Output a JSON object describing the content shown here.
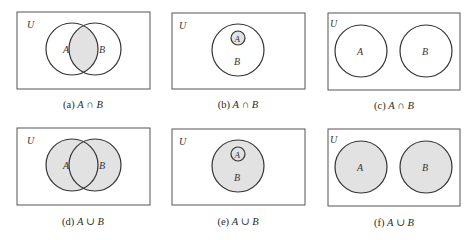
{
  "figure": {
    "colors": {
      "stroke": "#333333",
      "box_stroke": "#555555",
      "shade": "#e2e2e2",
      "background": "#ffffff"
    },
    "universe_label": "U",
    "set_a_label": "A",
    "set_b_label": "B",
    "panels": [
      {
        "id": "a",
        "caption_prefix": "(a)",
        "left": "A",
        "operator": "∩",
        "right": "B",
        "relation": "overlapping",
        "operation": "intersection",
        "shaded_region": "A ∩ B (lens where the circles overlap)"
      },
      {
        "id": "b",
        "caption_prefix": "(b)",
        "left": "A",
        "operator": "∩",
        "right": "B",
        "relation": "A subset of B",
        "operation": "intersection",
        "shaded_region": "A (A ∩ B = A because A ⊂ B)"
      },
      {
        "id": "c",
        "caption_prefix": "(c)",
        "left": "A",
        "operator": "∩",
        "right": "B",
        "relation": "disjoint",
        "operation": "intersection",
        "shaded_region": "none (A ∩ B = ∅)"
      },
      {
        "id": "d",
        "caption_prefix": "(d)",
        "left": "A",
        "operator": "∪",
        "right": "B",
        "relation": "overlapping",
        "operation": "union",
        "shaded_region": "A ∪ B (both circles)"
      },
      {
        "id": "e",
        "caption_prefix": "(e)",
        "left": "A",
        "operator": "∪",
        "right": "B",
        "relation": "A subset of B",
        "operation": "union",
        "shaded_region": "B (A ∪ B = B because A ⊂ B)"
      },
      {
        "id": "f",
        "caption_prefix": "(f)",
        "left": "A",
        "operator": "∪",
        "right": "B",
        "relation": "disjoint",
        "operation": "union",
        "shaded_region": "A ∪ B (both disjoint circles)"
      }
    ]
  }
}
